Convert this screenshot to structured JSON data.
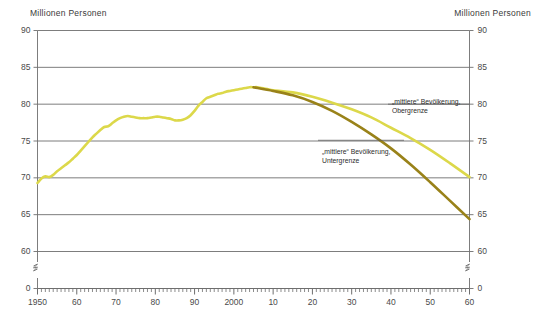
{
  "chart": {
    "title_left": "Millionen Personen",
    "title_right": "Millionen Personen",
    "y_ticks": [
      "90",
      "85",
      "80",
      "75",
      "70",
      "65",
      "60",
      "0"
    ],
    "x_ticks": [
      "1950",
      "60",
      "70",
      "80",
      "90",
      "2000",
      "10",
      "20",
      "30",
      "40",
      "50",
      "60"
    ],
    "colors": {
      "upper_line": "#dcd84a",
      "lower_line": "#998219",
      "gridline": "#6e6e6e",
      "axis": "#6e6e6e",
      "text": "#3a3a3a"
    },
    "annotations": [
      {
        "id": "obergrenze",
        "line1": "„mittlere“ Bevölkerung,",
        "line2": "Obergrenze"
      },
      {
        "id": "untergrenze",
        "line1": "„mittlere“ Bevölkerung,",
        "line2": "Untergrenze"
      }
    ]
  },
  "chart_data": {
    "type": "line",
    "title": "Millionen Personen",
    "xlabel": "",
    "ylabel": "Millionen Personen",
    "xlim": [
      1950,
      2060
    ],
    "ylim": [
      60,
      90
    ],
    "y_axis_break_below": 60,
    "y_break_label": "0",
    "grid": true,
    "grid_axis": "y",
    "legend_position": "inline-annotation",
    "x_major_tick_step": 10,
    "x_minor_tick_step": 1,
    "y_tick_step": 5,
    "x_tick_labels": [
      "1950",
      "60",
      "70",
      "80",
      "90",
      "2000",
      "10",
      "20",
      "30",
      "40",
      "50",
      "60"
    ],
    "y_tick_values": [
      60,
      65,
      70,
      75,
      80,
      85,
      90
    ],
    "series": [
      {
        "name": "„mittlere“ Bevölkerung, Obergrenze",
        "color": "#dcd84a",
        "x": [
          1950,
          1951,
          1952,
          1953,
          1954,
          1955,
          1956,
          1957,
          1958,
          1959,
          1960,
          1961,
          1962,
          1963,
          1964,
          1965,
          1966,
          1967,
          1968,
          1969,
          1970,
          1971,
          1972,
          1973,
          1974,
          1975,
          1976,
          1977,
          1978,
          1979,
          1980,
          1981,
          1982,
          1983,
          1984,
          1985,
          1986,
          1987,
          1988,
          1989,
          1990,
          1991,
          1992,
          1993,
          1994,
          1995,
          1996,
          1997,
          1998,
          1999,
          2000,
          2001,
          2002,
          2003,
          2004,
          2005,
          2006,
          2007,
          2008,
          2009,
          2010,
          2015,
          2020,
          2025,
          2030,
          2035,
          2040,
          2045,
          2050,
          2055,
          2060
        ],
        "y": [
          69.3,
          69.9,
          70.2,
          70.1,
          70.4,
          70.9,
          71.3,
          71.7,
          72.1,
          72.6,
          73.1,
          73.7,
          74.3,
          74.9,
          75.5,
          76.0,
          76.5,
          76.9,
          77.0,
          77.4,
          77.8,
          78.1,
          78.3,
          78.4,
          78.3,
          78.2,
          78.1,
          78.1,
          78.1,
          78.2,
          78.3,
          78.3,
          78.2,
          78.1,
          78.0,
          77.8,
          77.8,
          77.9,
          78.1,
          78.5,
          79.1,
          79.8,
          80.3,
          80.8,
          81.0,
          81.2,
          81.4,
          81.5,
          81.7,
          81.8,
          81.9,
          82.0,
          82.1,
          82.2,
          82.3,
          82.3,
          82.3,
          82.2,
          82.1,
          82.0,
          81.9,
          81.6,
          81.0,
          80.2,
          79.3,
          78.2,
          76.8,
          75.4,
          73.8,
          72.0,
          70.1
        ]
      },
      {
        "name": "„mittlere“ Bevölkerung, Untergrenze",
        "color": "#998219",
        "x": [
          2005,
          2010,
          2015,
          2020,
          2025,
          2030,
          2035,
          2040,
          2045,
          2050,
          2055,
          2060
        ],
        "y": [
          82.3,
          81.8,
          81.2,
          80.3,
          79.1,
          77.6,
          75.9,
          74.0,
          71.8,
          69.4,
          66.9,
          64.4
        ]
      }
    ],
    "annotations": [
      {
        "text": "„mittlere“ Bevölkerung, Obergrenze",
        "x": 2032,
        "y": 80.0
      },
      {
        "text": "„mittlere“ Bevölkerung, Untergrenze",
        "x": 2022,
        "y": 75.0
      }
    ]
  }
}
